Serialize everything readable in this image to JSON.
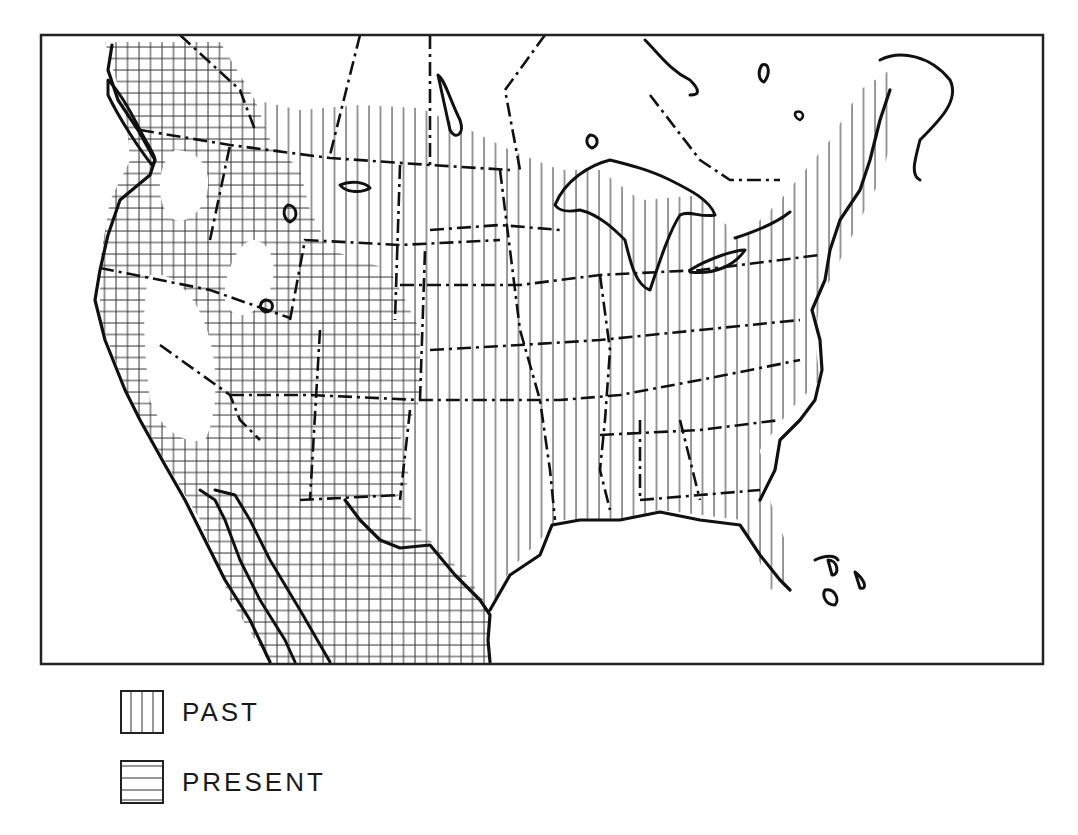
{
  "map": {
    "description": "Range map of North America (USA and northern Mexico) showing past and present distribution",
    "frame": {
      "left": 41,
      "top": 35,
      "right": 1043,
      "bottom": 664
    },
    "colors": {
      "ink": "#111111",
      "hatch": "#333333",
      "background": "#ffffff"
    }
  },
  "legend": {
    "items": [
      {
        "key": "past",
        "label": "PAST",
        "pattern": "vertical-lines"
      },
      {
        "key": "present",
        "label": "PRESENT",
        "pattern": "horizontal-lines"
      }
    ]
  }
}
